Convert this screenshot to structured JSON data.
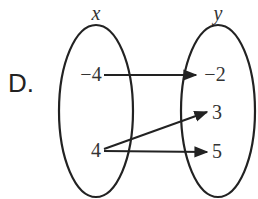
{
  "option_label": "D.",
  "domain_set": {
    "label": "x",
    "elements": [
      "−4",
      "4"
    ]
  },
  "range_set": {
    "label": "y",
    "elements": [
      "−2",
      "3",
      "5"
    ]
  },
  "mappings": [
    {
      "from": "−4",
      "to": "−2"
    },
    {
      "from": "4",
      "to": "3"
    },
    {
      "from": "4",
      "to": "5"
    }
  ]
}
